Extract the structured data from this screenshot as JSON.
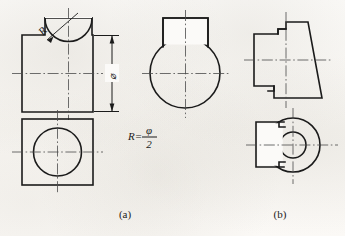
{
  "sheet": {
    "background_color": "#fbfaf8",
    "line_color": "#1b1b1b",
    "centerline_color": "#4a4a4a"
  },
  "captions": [
    {
      "id": "caption-a",
      "label": "(a)",
      "x": 125,
      "y": 218
    },
    {
      "id": "caption-b",
      "label": "(b)",
      "x": 280,
      "y": 218
    }
  ],
  "annotations": {
    "radius_label": "R",
    "diameter_label": "⌀",
    "formula": {
      "lhs": "R=",
      "numerator": "φ",
      "denominator": "2",
      "full": "R = φ / 2"
    }
  },
  "figure_a": {
    "title": "(a)",
    "front_view": {
      "name": "front-view-slotted-block",
      "body_rect": {
        "x": 22,
        "y": 35,
        "width": 71,
        "height": 77
      },
      "top_rect": {
        "x": 45,
        "y": 18,
        "width": 47,
        "height": 17
      },
      "arc_note": "concave semicircular cut at the top of the block",
      "arc_radius": 23
    },
    "side_view": {
      "name": "side-view-circle-with-cap",
      "circle": {
        "cx": 185,
        "cy": 73,
        "r": 35
      },
      "cap_rect": {
        "x": 163,
        "y": 18,
        "width": 45,
        "height": 28
      }
    },
    "bottom_view": {
      "name": "top-view-square-with-circle",
      "square": {
        "x": 22,
        "y": 119,
        "width": 71,
        "height": 66
      },
      "circle": {
        "cx": 57,
        "cy": 152,
        "r": 24
      }
    },
    "dimension": {
      "name": "diameter-dimension",
      "label": "⌀",
      "line_x": 112,
      "from_y": 35,
      "to_y": 112
    }
  },
  "figure_b": {
    "title": "(b)",
    "front_view": {
      "name": "front-view-trapezoid-with-notch",
      "outline_note": "trapezoid tapering to the right with a rectangular notch cut into the left face",
      "trapezoid": {
        "top_left_x": 286,
        "top_right_x": 308,
        "top_y": 22,
        "bottom_left_x": 274,
        "bottom_right_x": 322,
        "bottom_y": 98
      },
      "notch": {
        "x": 254,
        "y": 34,
        "width": 32,
        "height": 52
      }
    },
    "bottom_view": {
      "name": "top-view-annulus-with-tab",
      "outer_circle": {
        "cx": 293,
        "cy": 145,
        "r": 27
      },
      "inner_circle": {
        "cx": 293,
        "cy": 145,
        "r": 13
      },
      "tab": {
        "x": 254,
        "y": 122,
        "width": 39,
        "height": 45
      }
    }
  }
}
